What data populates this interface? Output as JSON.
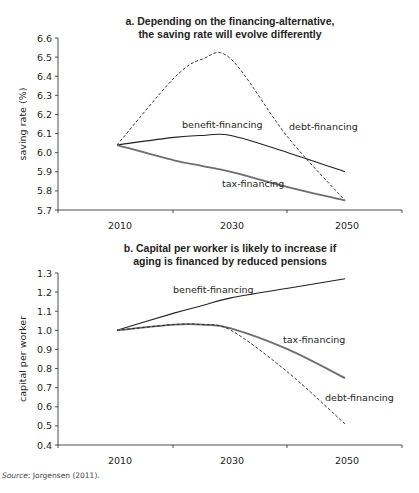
{
  "chart_data": [
    {
      "type": "line",
      "title": "a. Depending on the financing-alternative, the saving rate will evolve differently",
      "title_lines": [
        "a. Depending on the financing-alternative,",
        "the saving rate will evolve differently"
      ],
      "xlabel": "",
      "ylabel": "saving rate (%)",
      "ylim": [
        5.7,
        6.6
      ],
      "yticks": [
        "6.6",
        "6.5",
        "6.4",
        "6.3",
        "6.2",
        "6.1",
        "6.0",
        "5.9",
        "5.8",
        "5.7"
      ],
      "xticks": [
        "2010",
        "2030",
        "2050"
      ],
      "grid": false,
      "x": [
        2010,
        2020,
        2025,
        2030,
        2040,
        2050
      ],
      "series": [
        {
          "name": "debt-financing",
          "style": "dashed",
          "values": [
            6.04,
            6.39,
            6.49,
            6.49,
            6.08,
            5.75
          ]
        },
        {
          "name": "benefit-financing",
          "style": "solid",
          "values": [
            6.04,
            6.08,
            6.09,
            6.09,
            6.0,
            5.9
          ]
        },
        {
          "name": "tax-financing",
          "style": "solid-gray",
          "values": [
            6.04,
            5.96,
            5.93,
            5.9,
            5.82,
            5.75
          ]
        }
      ]
    },
    {
      "type": "line",
      "title": "b. Capital per worker is likely to increase if aging is financed by reduced pensions",
      "title_lines": [
        "b. Capital per worker is likely to increase if",
        "aging is financed by reduced pensions"
      ],
      "xlabel": "",
      "ylabel": "capital per worker",
      "ylim": [
        0.4,
        1.3
      ],
      "yticks": [
        "1.3",
        "1.2",
        "1.1",
        "1.0",
        "0.9",
        "0.8",
        "0.7",
        "0.6",
        "0.5",
        "0.4"
      ],
      "xticks": [
        "2010",
        "2030",
        "2050"
      ],
      "grid": false,
      "x": [
        2010,
        2020,
        2025,
        2030,
        2040,
        2050
      ],
      "series": [
        {
          "name": "benefit-financing",
          "style": "solid",
          "values": [
            1.0,
            1.09,
            1.13,
            1.17,
            1.22,
            1.27
          ]
        },
        {
          "name": "tax-financing",
          "style": "solid-gray",
          "values": [
            1.0,
            1.03,
            1.03,
            1.01,
            0.9,
            0.75
          ]
        },
        {
          "name": "debt-financing",
          "style": "dashed",
          "values": [
            1.0,
            1.03,
            1.03,
            1.0,
            0.78,
            0.51
          ]
        }
      ]
    }
  ],
  "source": {
    "label": "Source:",
    "text": "Jorgensen (2011)."
  }
}
